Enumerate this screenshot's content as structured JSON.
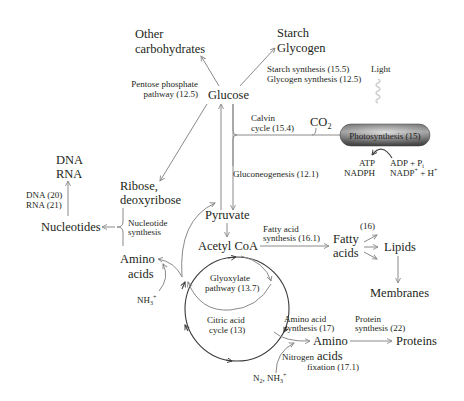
{
  "nodes": {
    "other_carbohydrates": [
      "Other",
      "carbohydrates"
    ],
    "starch_glycogen": [
      "Starch",
      "Glycogen"
    ],
    "glucose": "Glucose",
    "co2": "CO",
    "co2_sub": "2",
    "dna_rna": [
      "DNA",
      "RNA"
    ],
    "ribose": [
      "Ribose,",
      "deoxyribose"
    ],
    "nucleotides": "Nucleotides",
    "pyruvate": "Pyruvate",
    "acetyl_coa": "Acetyl CoA",
    "amino_acids_left": [
      "Amino",
      "acids"
    ],
    "fatty_acids": [
      "Fatty",
      "acids"
    ],
    "lipids": "Lipids",
    "membranes": "Membranes",
    "amino_acids_right": [
      "Amino",
      "acids"
    ],
    "proteins": "Proteins",
    "photosynthesis": "Photosynthesis (15)"
  },
  "labels": {
    "pentose": [
      "Pentose phosphate",
      "pathway (12.5)"
    ],
    "starch_synthesis": [
      "Starch synthesis (15.5)",
      "Glycogen synthesis (12.5)"
    ],
    "light": "Light",
    "calvin": [
      "Calvin",
      "cycle (15.4)"
    ],
    "atp": [
      "ATP",
      "NADPH"
    ],
    "adp": [
      "ADP + P",
      "NADP",
      " + H"
    ],
    "adp_sub": "i",
    "gluconeogenesis": "Gluconeogenesis (12.1)",
    "dna_rna_ref": [
      "DNA (20)",
      "RNA (21)"
    ],
    "nucleotide_synthesis": [
      "Nucleotide",
      "synthesis"
    ],
    "nh3": "NH",
    "nh3_sub": "3",
    "nh3_sup": "+",
    "fatty_acid_synthesis": [
      "Fatty acid",
      "synthesis (16.1)"
    ],
    "lipid_ref": "(16)",
    "glyoxylate": [
      "Glyoxylate",
      "pathway (13.7)"
    ],
    "citric": [
      "Citric acid",
      "cycle (13)"
    ],
    "amino_acid_synthesis": [
      "Amino acid",
      "synthesis (17)"
    ],
    "protein_synthesis": [
      "Protein",
      "synthesis (22)"
    ],
    "nitrogen": [
      "Nitrogen",
      "fixation (17.1)"
    ],
    "n2": "N",
    "n2_rest": ", NH",
    "plus": "+"
  },
  "colors": {
    "text": "#231f20",
    "arrow": "#8a8a8a",
    "cycle": "#3a3a3a",
    "pill_dark": "#5a5a5a",
    "pill_light": "#b8b8b8"
  }
}
